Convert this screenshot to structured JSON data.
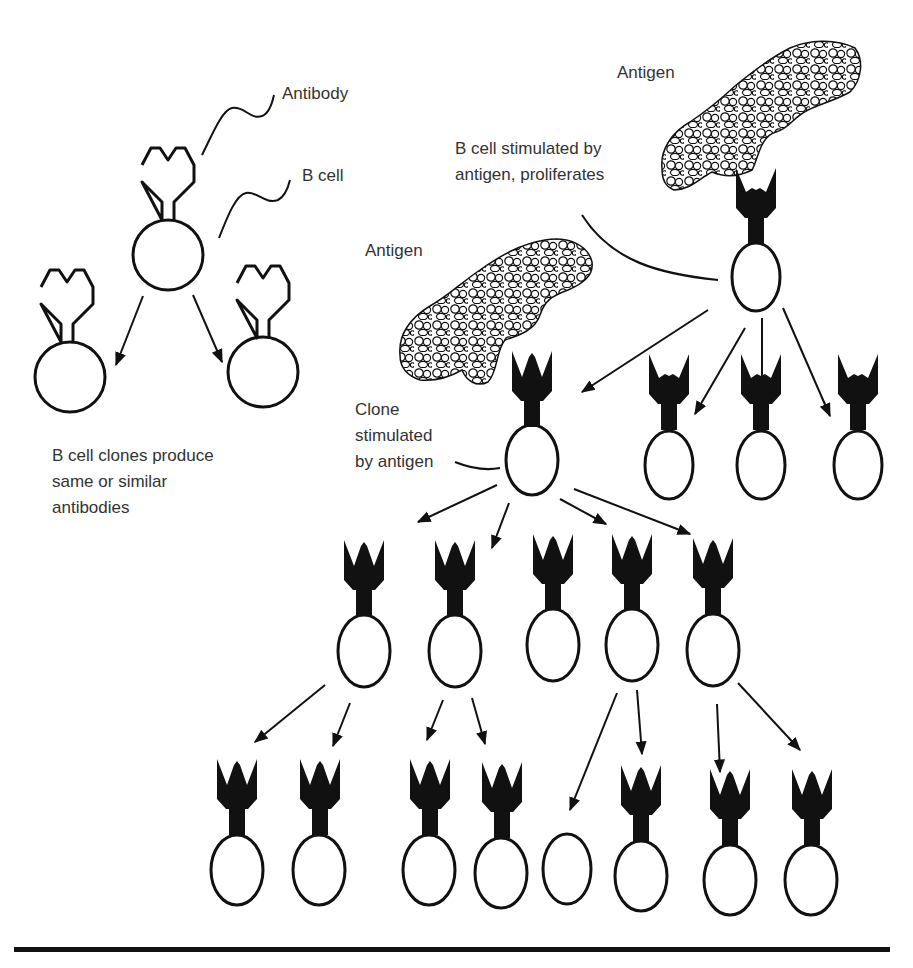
{
  "colors": {
    "ink": "#111111",
    "text": "#333333",
    "background": "#ffffff"
  },
  "labels": {
    "antibody": "Antibody",
    "b_cell": "B cell",
    "clones_produce": [
      "B cell clones produce",
      "same or similar",
      "antibodies"
    ],
    "antigen_top": "Antigen",
    "stimulated_proliferates": [
      "B cell stimulated by",
      "antigen, proliferates"
    ],
    "antigen_lower": "Antigen",
    "clone_stimulated": [
      "Clone",
      "stimulated",
      "by antigen"
    ]
  },
  "left_panel": {
    "description": "Unstimulated B cell with outlined antibody receptor dividing into two clones",
    "cells": [
      {
        "role": "parent",
        "cx": 168,
        "cy": 250
      },
      {
        "role": "clone",
        "cx": 70,
        "cy": 370
      },
      {
        "role": "clone",
        "cx": 263,
        "cy": 372
      }
    ]
  },
  "right_panel": {
    "stimulated_cell": {
      "cx": 756,
      "cy": 275
    },
    "row2": [
      {
        "cx": 532,
        "cy": 458,
        "role": "clone-stimulated"
      },
      {
        "cx": 669,
        "cy": 458
      },
      {
        "cx": 761,
        "cy": 458
      },
      {
        "cx": 858,
        "cy": 458
      }
    ],
    "row3": [
      {
        "cx": 364,
        "cy": 650
      },
      {
        "cx": 454,
        "cy": 650
      },
      {
        "cx": 553,
        "cy": 645
      },
      {
        "cx": 632,
        "cy": 645
      },
      {
        "cx": 713,
        "cy": 650
      }
    ],
    "row4": [
      {
        "cx": 237,
        "cy": 870,
        "antibody": true
      },
      {
        "cx": 316,
        "cy": 870,
        "antibody": true
      },
      {
        "cx": 427,
        "cy": 870,
        "antibody": true
      },
      {
        "cx": 499,
        "cy": 873,
        "antibody": true
      },
      {
        "cx": 567,
        "cy": 869,
        "antibody": false
      },
      {
        "cx": 641,
        "cy": 875,
        "antibody": true
      },
      {
        "cx": 730,
        "cy": 880,
        "antibody": true
      },
      {
        "cx": 811,
        "cy": 880,
        "antibody": true
      }
    ]
  }
}
